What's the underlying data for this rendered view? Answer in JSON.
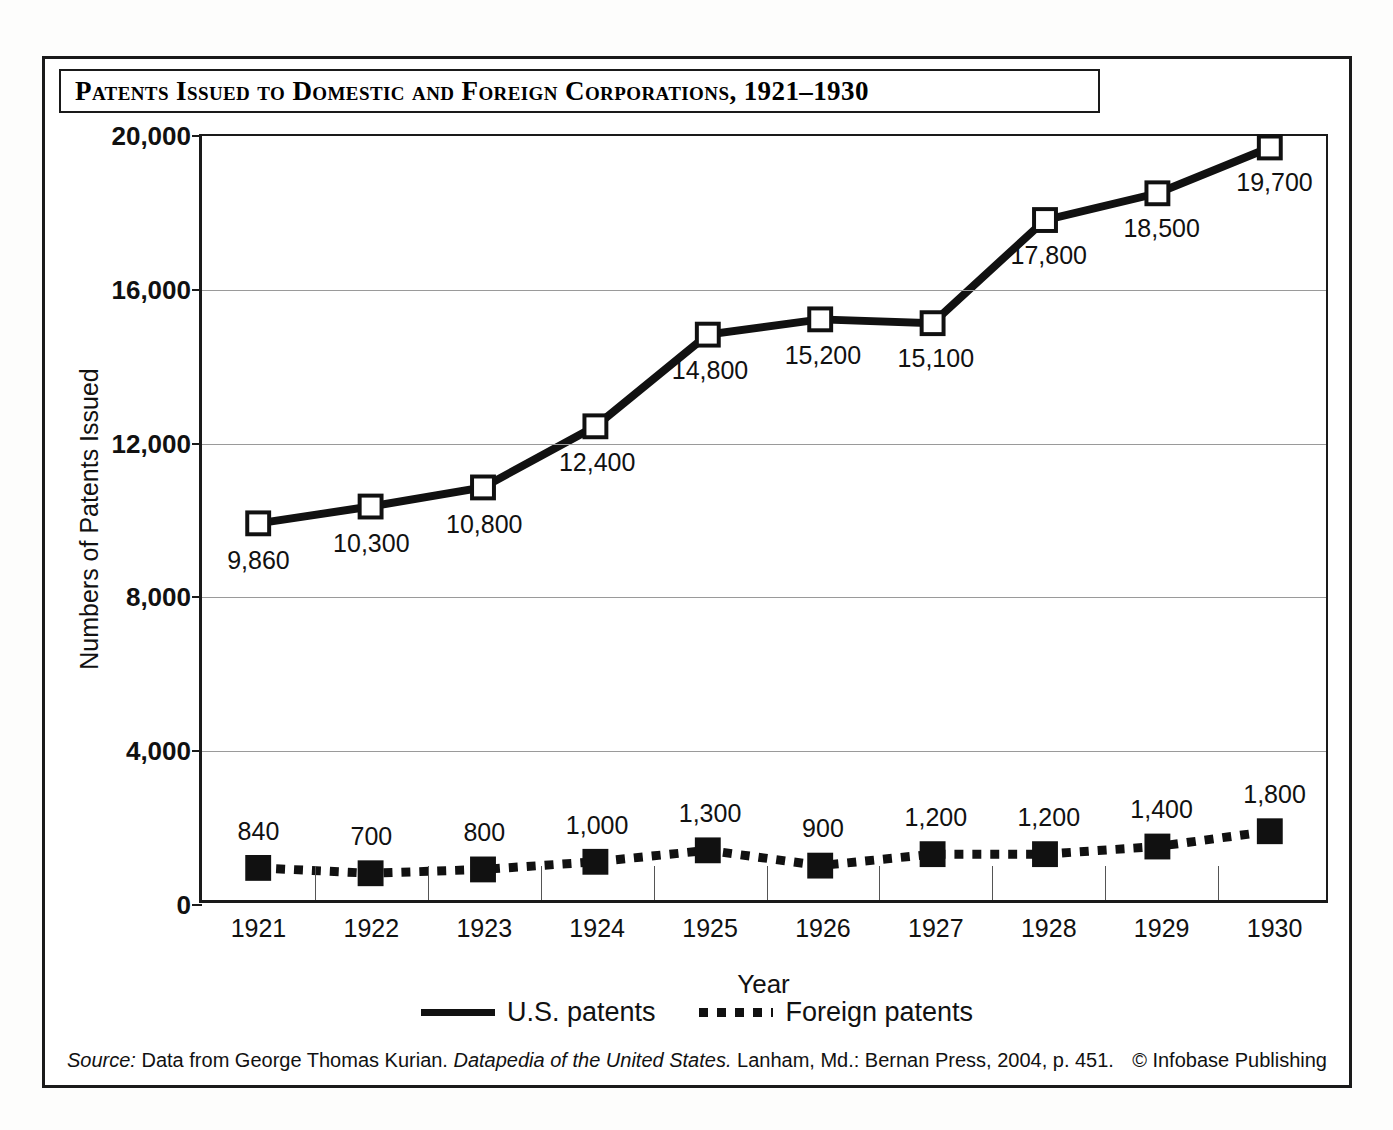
{
  "title": "Patents Issued to Domestic and Foreign Corporations, 1921–1930",
  "axis": {
    "x_title": "Year",
    "y_title": "Numbers of Patents Issued"
  },
  "legend": {
    "items": [
      {
        "label": "U.S. patents",
        "style": "solid",
        "marker": "open-square"
      },
      {
        "label": "Foreign patents",
        "style": "dotted",
        "marker": "filled-square"
      }
    ]
  },
  "footer": {
    "source_prefix": "Source:",
    "source_part1": " Data from George Thomas Kurian. ",
    "source_italic": "Datapedia of the United States.",
    "source_part2": " Lanham, Md.: Bernan Press, 2004, p. 451.",
    "credit": "© Infobase Publishing"
  },
  "colors": {
    "line": "#111111",
    "grid": "#9a9a9a",
    "frame": "#1a1a1a",
    "background": "#ffffff"
  },
  "chart_data": {
    "type": "line",
    "title": "Patents Issued to Domestic and Foreign Corporations, 1921–1930",
    "xlabel": "Year",
    "ylabel": "Numbers of Patents Issued",
    "categories": [
      "1921",
      "1922",
      "1923",
      "1924",
      "1925",
      "1926",
      "1927",
      "1928",
      "1929",
      "1930"
    ],
    "ylim": [
      0,
      20000
    ],
    "yticks": [
      0,
      4000,
      8000,
      12000,
      16000,
      20000
    ],
    "ytick_labels": [
      "0",
      "4,000",
      "8,000",
      "12,000",
      "16,000",
      "20,000"
    ],
    "grid": "horizontal",
    "legend_position": "bottom-center",
    "series": [
      {
        "name": "U.S. patents",
        "style": "solid",
        "marker": "open-square",
        "values": [
          9860,
          10300,
          10800,
          12400,
          14800,
          15200,
          15100,
          17800,
          18500,
          19700
        ],
        "labels": [
          "9,860",
          "10,300",
          "10,800",
          "12,400",
          "14,800",
          "15,200",
          "15,100",
          "17,800",
          "18,500",
          "19,700"
        ],
        "label_positions": [
          "below",
          "below",
          "below",
          "below",
          "below",
          "below",
          "below",
          "below",
          "below",
          "below"
        ]
      },
      {
        "name": "Foreign patents",
        "style": "dotted",
        "marker": "filled-square",
        "values": [
          840,
          700,
          800,
          1000,
          1300,
          900,
          1200,
          1200,
          1400,
          1800
        ],
        "labels": [
          "840",
          "700",
          "800",
          "1,000",
          "1,300",
          "900",
          "1,200",
          "1,200",
          "1,400",
          "1,800"
        ],
        "label_positions": [
          "above",
          "above",
          "above",
          "above",
          "above",
          "above",
          "above",
          "above",
          "above",
          "above"
        ]
      }
    ]
  }
}
